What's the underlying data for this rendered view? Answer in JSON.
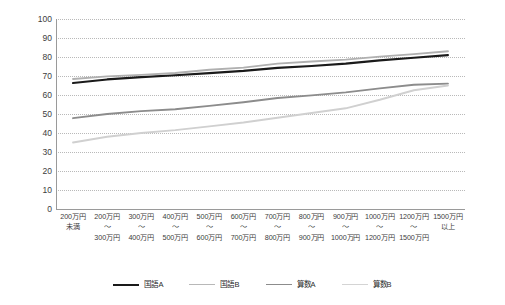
{
  "chart_data": {
    "type": "line",
    "title": "",
    "subtitle": "",
    "xlabel": "",
    "ylabel": "",
    "ylim": [
      0,
      100
    ],
    "ytick_step": 10,
    "yticks": [
      100,
      90,
      80,
      70,
      60,
      50,
      40,
      30,
      20,
      10,
      0
    ],
    "grid": "horizontal-dotted",
    "legend_position": "bottom-center",
    "categories": [
      "200万円\n未満",
      "200万円\n〜\n300万円",
      "300万円\n〜\n400万円",
      "400万円\n〜\n500万円",
      "500万円\n〜\n600万円",
      "600万円\n〜\n700万円",
      "700万円\n〜\n800万円",
      "800万円\n〜\n900万円",
      "900万円\n〜\n1000万円",
      "1000万円\n〜\n1200万円",
      "1200万円\n〜\n1500万円",
      "1500万円\n以上"
    ],
    "category_lines": [
      [
        "200万円",
        "未満",
        ""
      ],
      [
        "200万円",
        "〜",
        "300万円"
      ],
      [
        "300万円",
        "〜",
        "400万円"
      ],
      [
        "400万円",
        "〜",
        "500万円"
      ],
      [
        "500万円",
        "〜",
        "600万円"
      ],
      [
        "600万円",
        "〜",
        "700万円"
      ],
      [
        "700万円",
        "〜",
        "800万円"
      ],
      [
        "800万円",
        "〜",
        "900万円"
      ],
      [
        "900万円",
        "〜",
        "1000万円"
      ],
      [
        "1000万円",
        "〜",
        "1200万円"
      ],
      [
        "1200万円",
        "〜",
        "1500万円"
      ],
      [
        "1500万円",
        "以上",
        ""
      ]
    ],
    "series": [
      {
        "name": "国語A",
        "color": "#1a1a1a",
        "width": 2.1,
        "values": [
          66.3,
          68.2,
          69.4,
          70.4,
          71.5,
          72.7,
          74.3,
          75.3,
          76.5,
          78.2,
          79.6,
          81.0
        ]
      },
      {
        "name": "国語B",
        "color": "#b0b0b0",
        "width": 1.9,
        "values": [
          68.4,
          69.8,
          70.6,
          71.6,
          73.3,
          74.4,
          76.5,
          77.6,
          78.6,
          80.2,
          81.5,
          83.0
        ]
      },
      {
        "name": "算数A",
        "color": "#8c8c8c",
        "width": 1.9,
        "values": [
          47.8,
          50.0,
          51.5,
          52.5,
          54.3,
          56.2,
          58.4,
          59.8,
          61.4,
          63.5,
          65.4,
          66.0
        ]
      },
      {
        "name": "算数B",
        "color": "#d0d0d0",
        "width": 1.9,
        "values": [
          35.0,
          38.0,
          40.0,
          41.5,
          43.5,
          45.5,
          48.0,
          50.5,
          53.0,
          57.5,
          62.5,
          65.0
        ]
      }
    ]
  },
  "legend": {
    "items": [
      {
        "label": "国語A",
        "color": "#1a1a1a",
        "width": 2.4
      },
      {
        "label": "国語B",
        "color": "#b8b8b8",
        "width": 1.6
      },
      {
        "label": "算数A",
        "color": "#8c8c8c",
        "width": 1.8
      },
      {
        "label": "算数B",
        "color": "#d4d4d4",
        "width": 1.6
      }
    ]
  },
  "axis": {
    "y_max_label": "100",
    "y_min_label": "0"
  }
}
